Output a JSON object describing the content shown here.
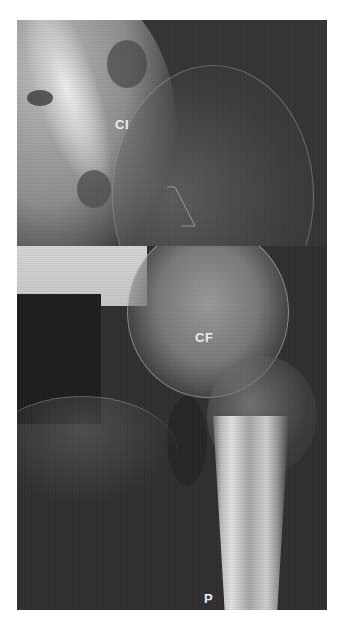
{
  "figure": {
    "panels": [
      {
        "id": "top",
        "region": "pelvis / iliac region",
        "label": "CI"
      },
      {
        "id": "bottom",
        "region": "hip joint and proximal femur",
        "labels": [
          "CF",
          "P"
        ]
      }
    ],
    "labels": {
      "ci": "CI",
      "cf": "CF",
      "p": "P"
    },
    "colors": {
      "background": "#ffffff",
      "film_dark": "#2e2e2e",
      "bone_light": "#e8e8e8",
      "redaction": "#1e1e1e",
      "label_text": "#f2f2f2"
    }
  }
}
